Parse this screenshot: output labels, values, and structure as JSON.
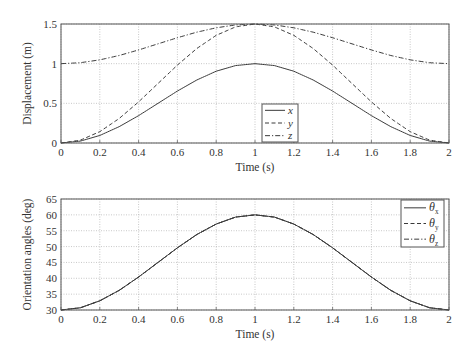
{
  "chart_data": [
    {
      "type": "line",
      "title": "",
      "xlabel": "Time (s)",
      "ylabel": "Displacement (m)",
      "xlim": [
        0,
        2
      ],
      "ylim": [
        0,
        1.5
      ],
      "xticks": [
        "0",
        "0.2",
        "0.4",
        "0.6",
        "0.8",
        "1",
        "1.2",
        "1.4",
        "1.6",
        "1.8",
        "2"
      ],
      "yticks": [
        "0",
        "0.5",
        "1",
        "1.5"
      ],
      "grid": true,
      "legend_position": "lower center",
      "x": [
        0,
        0.1,
        0.2,
        0.3,
        0.4,
        0.5,
        0.6,
        0.7,
        0.8,
        0.9,
        1.0,
        1.1,
        1.2,
        1.3,
        1.4,
        1.5,
        1.6,
        1.7,
        1.8,
        1.9,
        2.0
      ],
      "series": [
        {
          "name": "x",
          "style": "solid",
          "values": [
            0,
            0.024,
            0.095,
            0.206,
            0.345,
            0.5,
            0.655,
            0.794,
            0.905,
            0.976,
            1.0,
            0.976,
            0.905,
            0.794,
            0.655,
            0.5,
            0.345,
            0.206,
            0.095,
            0.024,
            0
          ]
        },
        {
          "name": "y",
          "style": "dashed",
          "values": [
            0,
            0.036,
            0.143,
            0.309,
            0.518,
            0.75,
            0.982,
            1.191,
            1.357,
            1.464,
            1.5,
            1.464,
            1.357,
            1.191,
            0.982,
            0.75,
            0.518,
            0.309,
            0.143,
            0.036,
            0
          ]
        },
        {
          "name": "z",
          "style": "dashdot",
          "values": [
            1.0,
            1.012,
            1.048,
            1.103,
            1.173,
            1.25,
            1.327,
            1.397,
            1.452,
            1.488,
            1.5,
            1.488,
            1.452,
            1.397,
            1.327,
            1.25,
            1.173,
            1.103,
            1.048,
            1.012,
            1.0
          ]
        }
      ]
    },
    {
      "type": "line",
      "title": "",
      "xlabel": "Time (s)",
      "ylabel": "Orientation angles (deg)",
      "xlim": [
        0,
        2
      ],
      "ylim": [
        30,
        65
      ],
      "xticks": [
        "0",
        "0.2",
        "0.4",
        "0.6",
        "0.8",
        "1",
        "1.2",
        "1.4",
        "1.6",
        "1.8",
        "2"
      ],
      "yticks": [
        "30",
        "35",
        "40",
        "45",
        "50",
        "55",
        "60",
        "65"
      ],
      "grid": true,
      "legend_position": "upper right",
      "x": [
        0,
        0.1,
        0.2,
        0.3,
        0.4,
        0.5,
        0.6,
        0.7,
        0.8,
        0.9,
        1.0,
        1.1,
        1.2,
        1.3,
        1.4,
        1.5,
        1.6,
        1.7,
        1.8,
        1.9,
        2.0
      ],
      "series": [
        {
          "name": "θx",
          "style": "solid",
          "values": [
            30,
            30.7,
            32.9,
            36.2,
            40.4,
            45,
            49.6,
            53.8,
            57.1,
            59.3,
            60,
            59.3,
            57.1,
            53.8,
            49.6,
            45,
            40.4,
            36.2,
            32.9,
            30.7,
            30
          ]
        },
        {
          "name": "θy",
          "style": "dashed",
          "values": [
            30,
            30.7,
            32.9,
            36.2,
            40.4,
            45,
            49.6,
            53.8,
            57.1,
            59.3,
            60,
            59.3,
            57.1,
            53.8,
            49.6,
            45,
            40.4,
            36.2,
            32.9,
            30.7,
            30
          ]
        },
        {
          "name": "θz",
          "style": "dashdot",
          "values": [
            30,
            30.7,
            32.9,
            36.2,
            40.4,
            45,
            49.6,
            53.8,
            57.1,
            59.3,
            60,
            59.3,
            57.1,
            53.8,
            49.6,
            45,
            40.4,
            36.2,
            32.9,
            30.7,
            30
          ]
        }
      ]
    }
  ],
  "panels": [
    {
      "xlabel": "Time (s)",
      "ylabel": "Displacement (m)",
      "legend": [
        {
          "main": "x",
          "sub": ""
        },
        {
          "main": "y",
          "sub": ""
        },
        {
          "main": "z",
          "sub": ""
        }
      ]
    },
    {
      "xlabel": "Time (s)",
      "ylabel": "Orientation angles (deg)",
      "legend": [
        {
          "main": "θ",
          "sub": "x"
        },
        {
          "main": "θ",
          "sub": "y"
        },
        {
          "main": "θ",
          "sub": "z"
        }
      ]
    }
  ],
  "colors": {
    "line": "#3a3a3a",
    "axis": "#555555",
    "grid": "#b0b0b0"
  }
}
